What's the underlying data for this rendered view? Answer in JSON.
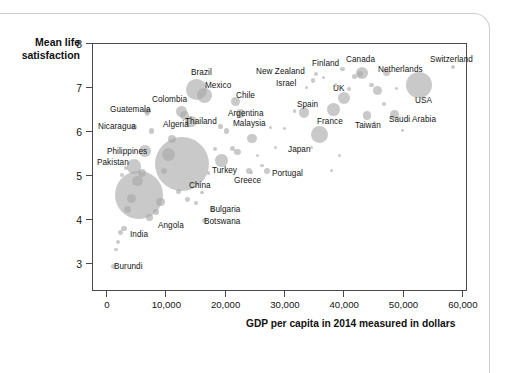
{
  "chart_data": {
    "type": "scatter",
    "title": "",
    "xlabel": "GDP per capita in 2014 measured in dollars",
    "ylabel": "Mean life satisfaction",
    "xlim": [
      -2000,
      63000
    ],
    "ylim": [
      2.35,
      8.0
    ],
    "grid": false,
    "legend": "none",
    "note": "Bubble scatter; marker area scales with population.",
    "xticks": [
      "0",
      "10,000",
      "20,000",
      "30,000",
      "40,000",
      "50,000",
      "60,000"
    ],
    "xtick_values": [
      0,
      10000,
      20000,
      30000,
      40000,
      50000,
      60000
    ],
    "yticks": [
      "8",
      "7",
      "6",
      "5",
      "4",
      "3"
    ],
    "ytick_values": [
      8,
      7,
      6,
      5,
      4,
      3
    ],
    "labeled_points": [
      {
        "name": "Switzerland",
        "x": 58500,
        "y": 7.46,
        "r": 2.0,
        "lx": 430,
        "ly": 56,
        "anchor": "left"
      },
      {
        "name": "Canada",
        "x": 43200,
        "y": 7.32,
        "r": 6.0,
        "lx": 346,
        "ly": 56,
        "anchor": "left"
      },
      {
        "name": "Netherlands",
        "x": 47300,
        "y": 7.33,
        "r": 3.5,
        "lx": 378,
        "ly": 66,
        "anchor": "left"
      },
      {
        "name": "Finland",
        "x": 39900,
        "y": 7.41,
        "r": 2.2,
        "lx": 312,
        "ly": 60,
        "anchor": "left"
      },
      {
        "name": "New Zealand",
        "x": 35400,
        "y": 7.29,
        "r": 2.2,
        "lx": 256,
        "ly": 68,
        "anchor": "left"
      },
      {
        "name": "Israel",
        "x": 34900,
        "y": 7.14,
        "r": 2.4,
        "lx": 276,
        "ly": 80,
        "anchor": "left"
      },
      {
        "name": "USA",
        "x": 52800,
        "y": 7.04,
        "r": 13.0,
        "lx": 415,
        "ly": 97,
        "anchor": "left"
      },
      {
        "name": "UK",
        "x": 40100,
        "y": 6.75,
        "r": 6.0,
        "lx": 333,
        "ly": 85,
        "anchor": "left"
      },
      {
        "name": "Spain",
        "x": 33400,
        "y": 6.42,
        "r": 5.2,
        "lx": 297,
        "ly": 101,
        "anchor": "left"
      },
      {
        "name": "France",
        "x": 38400,
        "y": 6.48,
        "r": 6.4,
        "lx": 317,
        "ly": 118,
        "anchor": "left"
      },
      {
        "name": "Taiwan",
        "x": 44000,
        "y": 6.35,
        "r": 4.3,
        "lx": 355,
        "ly": 122,
        "anchor": "left"
      },
      {
        "name": "Saudi Arabia",
        "x": 48600,
        "y": 6.38,
        "r": 4.6,
        "lx": 389,
        "ly": 116,
        "anchor": "left"
      },
      {
        "name": "Japan",
        "x": 36000,
        "y": 5.92,
        "r": 8.5,
        "lx": 288,
        "ly": 146,
        "anchor": "left"
      },
      {
        "name": "Portugal",
        "x": 27100,
        "y": 5.08,
        "r": 3.0,
        "lx": 272,
        "ly": 170,
        "anchor": "left"
      },
      {
        "name": "Greece",
        "x": 24100,
        "y": 5.1,
        "r": 3.0,
        "lx": 234,
        "ly": 177,
        "anchor": "left"
      },
      {
        "name": "Turkey",
        "x": 19500,
        "y": 5.33,
        "r": 6.4,
        "lx": 212,
        "ly": 167,
        "anchor": "left"
      },
      {
        "name": "Chile",
        "x": 21900,
        "y": 6.67,
        "r": 4.4,
        "lx": 236,
        "ly": 92,
        "anchor": "left"
      },
      {
        "name": "Argentina",
        "x": 22700,
        "y": 6.4,
        "r": 4.6,
        "lx": 228,
        "ly": 110,
        "anchor": "left"
      },
      {
        "name": "Malaysia",
        "x": 24600,
        "y": 5.83,
        "r": 4.8,
        "lx": 233,
        "ly": 120,
        "anchor": "left"
      },
      {
        "name": "Brazil",
        "x": 15300,
        "y": 6.95,
        "r": 10.5,
        "lx": 191,
        "ly": 69,
        "anchor": "left"
      },
      {
        "name": "Mexico",
        "x": 16600,
        "y": 6.8,
        "r": 7.5,
        "lx": 205,
        "ly": 82,
        "anchor": "left"
      },
      {
        "name": "Colombia",
        "x": 12700,
        "y": 6.44,
        "r": 5.2,
        "lx": 152,
        "ly": 96,
        "anchor": "left"
      },
      {
        "name": "Thailand",
        "x": 14300,
        "y": 6.22,
        "r": 5.8,
        "lx": 185,
        "ly": 118,
        "anchor": "left"
      },
      {
        "name": "Algeria",
        "x": 13200,
        "y": 6.35,
        "r": 4.5,
        "lx": 163,
        "ly": 121,
        "anchor": "left"
      },
      {
        "name": "Guatemala",
        "x": 7000,
        "y": 6.46,
        "r": 3.2,
        "lx": 110,
        "ly": 106,
        "anchor": "left"
      },
      {
        "name": "Nicaragua",
        "x": 4700,
        "y": 6.09,
        "r": 2.8,
        "lx": 98,
        "ly": 123,
        "anchor": "left"
      },
      {
        "name": "Philippines",
        "x": 6600,
        "y": 5.55,
        "r": 5.8,
        "lx": 107,
        "ly": 148,
        "anchor": "left"
      },
      {
        "name": "Pakistan",
        "x": 4700,
        "y": 5.19,
        "r": 7.2,
        "lx": 97,
        "ly": 159,
        "anchor": "left"
      },
      {
        "name": "China",
        "x": 12900,
        "y": 5.25,
        "r": 27.0,
        "lx": 189,
        "ly": 182,
        "anchor": "left"
      },
      {
        "name": "India",
        "x": 5500,
        "y": 4.54,
        "r": 24.0,
        "lx": 130,
        "ly": 231,
        "anchor": "left"
      },
      {
        "name": "Angola",
        "x": 7300,
        "y": 4.03,
        "r": 3.3,
        "lx": 158,
        "ly": 222,
        "anchor": "left"
      },
      {
        "name": "Bulgaria",
        "x": 17900,
        "y": 4.22,
        "r": 2.6,
        "lx": 210,
        "ly": 206,
        "anchor": "left"
      },
      {
        "name": "Botswana",
        "x": 16600,
        "y": 3.97,
        "r": 2.4,
        "lx": 204,
        "ly": 218,
        "anchor": "left"
      },
      {
        "name": "Burundi",
        "x": 1200,
        "y": 2.92,
        "r": 2.4,
        "lx": 114,
        "ly": 263,
        "anchor": "left"
      }
    ],
    "unlabeled_bubbles": [
      {
        "x": 42800,
        "y": 7.3,
        "r": 3.2
      },
      {
        "x": 41900,
        "y": 7.23,
        "r": 2.6
      },
      {
        "x": 44800,
        "y": 7.05,
        "r": 2.2
      },
      {
        "x": 45800,
        "y": 6.92,
        "r": 4.4
      },
      {
        "x": 46900,
        "y": 6.62,
        "r": 1.9
      },
      {
        "x": 49000,
        "y": 6.96,
        "r": 1.7
      },
      {
        "x": 41000,
        "y": 6.95,
        "r": 2.0
      },
      {
        "x": 38700,
        "y": 7.05,
        "r": 1.8
      },
      {
        "x": 36700,
        "y": 7.22,
        "r": 1.7
      },
      {
        "x": 33800,
        "y": 6.98,
        "r": 1.6
      },
      {
        "x": 31800,
        "y": 6.46,
        "r": 1.8
      },
      {
        "x": 30100,
        "y": 6.05,
        "r": 1.6
      },
      {
        "x": 28600,
        "y": 5.62,
        "r": 1.5
      },
      {
        "x": 26300,
        "y": 5.22,
        "r": 1.6
      },
      {
        "x": 25600,
        "y": 5.44,
        "r": 1.5
      },
      {
        "x": 24500,
        "y": 5.05,
        "r": 1.6
      },
      {
        "x": 22200,
        "y": 5.52,
        "r": 3.2
      },
      {
        "x": 21300,
        "y": 5.6,
        "r": 2.8
      },
      {
        "x": 20300,
        "y": 6.0,
        "r": 2.6
      },
      {
        "x": 19300,
        "y": 6.1,
        "r": 2.2
      },
      {
        "x": 18300,
        "y": 5.58,
        "r": 2.0
      },
      {
        "x": 17300,
        "y": 5.05,
        "r": 1.8
      },
      {
        "x": 16200,
        "y": 4.6,
        "r": 1.7
      },
      {
        "x": 15200,
        "y": 4.36,
        "r": 1.9
      },
      {
        "x": 13800,
        "y": 4.45,
        "r": 2.4
      },
      {
        "x": 12200,
        "y": 4.62,
        "r": 2.6
      },
      {
        "x": 11200,
        "y": 5.82,
        "r": 4.0
      },
      {
        "x": 10600,
        "y": 5.47,
        "r": 6.5
      },
      {
        "x": 9700,
        "y": 5.08,
        "r": 3.0
      },
      {
        "x": 9200,
        "y": 4.38,
        "r": 4.2
      },
      {
        "x": 8400,
        "y": 4.16,
        "r": 2.8
      },
      {
        "x": 7700,
        "y": 6.0,
        "r": 2.6
      },
      {
        "x": 6900,
        "y": 6.4,
        "r": 2.2
      },
      {
        "x": 6100,
        "y": 5.05,
        "r": 4.0
      },
      {
        "x": 5300,
        "y": 4.86,
        "r": 5.2
      },
      {
        "x": 4300,
        "y": 4.46,
        "r": 4.6
      },
      {
        "x": 3600,
        "y": 4.22,
        "r": 3.4
      },
      {
        "x": 3000,
        "y": 3.78,
        "r": 2.8
      },
      {
        "x": 2400,
        "y": 3.7,
        "r": 2.4
      },
      {
        "x": 2000,
        "y": 3.48,
        "r": 2.0
      },
      {
        "x": 1700,
        "y": 3.3,
        "r": 1.7
      },
      {
        "x": 2700,
        "y": 5.0,
        "r": 2.2
      },
      {
        "x": 3300,
        "y": 5.15,
        "r": 2.0
      },
      {
        "x": 34600,
        "y": 5.62,
        "r": 1.5
      },
      {
        "x": 39300,
        "y": 5.45,
        "r": 1.5
      },
      {
        "x": 38000,
        "y": 5.1,
        "r": 1.6
      },
      {
        "x": 27800,
        "y": 6.08,
        "r": 1.6
      },
      {
        "x": 50000,
        "y": 6.02,
        "r": 1.4
      },
      {
        "x": 45200,
        "y": 6.2,
        "r": 1.5
      }
    ]
  },
  "axis": {
    "y_title_line1": "Mean life",
    "y_title_line2": "satisfaction",
    "x_title": "GDP per capita in 2014 measured in dollars"
  }
}
